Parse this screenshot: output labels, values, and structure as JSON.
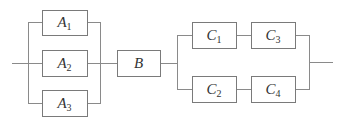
{
  "diagram": {
    "type": "reliability-block-diagram",
    "stroke_color": "#8a8a8a",
    "text_color": "#333333",
    "blocks": [
      {
        "id": "A1",
        "letter": "A",
        "sub": "1",
        "x": 42,
        "y": 10,
        "w": 45,
        "h": 25
      },
      {
        "id": "A2",
        "letter": "A",
        "sub": "2",
        "x": 42,
        "y": 50,
        "w": 45,
        "h": 26
      },
      {
        "id": "A3",
        "letter": "A",
        "sub": "3",
        "x": 42,
        "y": 90,
        "w": 45,
        "h": 26
      },
      {
        "id": "B",
        "letter": "B",
        "sub": "",
        "x": 117,
        "y": 50,
        "w": 43,
        "h": 26
      },
      {
        "id": "C1",
        "letter": "C",
        "sub": "1",
        "x": 192,
        "y": 23,
        "w": 44,
        "h": 26
      },
      {
        "id": "C3",
        "letter": "C",
        "sub": "3",
        "x": 251,
        "y": 23,
        "w": 44,
        "h": 26
      },
      {
        "id": "C2",
        "letter": "C",
        "sub": "2",
        "x": 192,
        "y": 77,
        "w": 44,
        "h": 25
      },
      {
        "id": "C4",
        "letter": "C",
        "sub": "4",
        "x": 251,
        "y": 77,
        "w": 44,
        "h": 25
      }
    ],
    "structure": "(A1 || A2 || A3) -> B -> ((C1 -> C3) || (C2 -> C4))"
  }
}
